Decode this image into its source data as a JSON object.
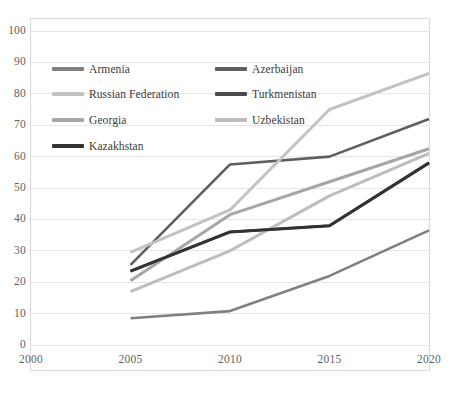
{
  "chart_data": {
    "type": "line",
    "title": "",
    "xlabel": "",
    "ylabel": "",
    "categories": [
      2000,
      2005,
      2010,
      2015,
      2020
    ],
    "xlim": [
      2000,
      2020
    ],
    "ylim": [
      0,
      100
    ],
    "ytick_step": 10,
    "grid": "horizontal",
    "legend_position": "inside-top-left",
    "yticks": [
      "0",
      "10",
      "20",
      "30",
      "40",
      "50",
      "60",
      "70",
      "80",
      "90",
      "100"
    ],
    "xticks": [
      "2000",
      "2005",
      "2010",
      "2015",
      "2020"
    ],
    "series": [
      {
        "name": "Armenia",
        "color": "#808080",
        "width": 2.6,
        "x": [
          2005,
          2010,
          2015,
          2020
        ],
        "values": [
          8.5,
          10.8,
          22.0,
          36.5
        ]
      },
      {
        "name": "Azerbaijan",
        "color": "#5f5f5f",
        "width": 2.6,
        "x": [
          2005,
          2010,
          2015,
          2020
        ],
        "values": [
          25.5,
          57.5,
          60.0,
          72.0
        ]
      },
      {
        "name": "Russian Federation",
        "color": "#c2c2c2",
        "width": 3.0,
        "x": [
          2005,
          2010,
          2015,
          2020
        ],
        "values": [
          29.5,
          43.0,
          75.0,
          86.5
        ]
      },
      {
        "name": "Turkmenistan",
        "color": "#3c3c3c",
        "width": 2.6,
        "x": [
          2005,
          2010,
          2015,
          2020
        ],
        "values": [
          23.5,
          36.0,
          38.0,
          58.0
        ]
      },
      {
        "name": "Georgia",
        "color": "#a6a6a6",
        "width": 3.0,
        "x": [
          2005,
          2010,
          2015,
          2020
        ],
        "values": [
          20.5,
          41.5,
          52.0,
          62.5
        ]
      },
      {
        "name": "Uzbekistan",
        "color": "#bdbdbd",
        "width": 3.0,
        "x": [
          2005,
          2010,
          2015,
          2020
        ],
        "values": [
          17.0,
          30.0,
          47.5,
          61.0
        ]
      },
      {
        "name": "Kazakhstan",
        "color": "#333333",
        "width": 3.0,
        "x": [
          2005,
          2010,
          2015,
          2020
        ],
        "values": [
          23.5,
          36.0,
          38.0,
          58.0
        ]
      }
    ]
  },
  "legend": {
    "rows": [
      {
        "left": {
          "label": "Armenia",
          "color": "#808080",
          "thickness": 4
        },
        "right": {
          "label": "Azerbaijan",
          "color": "#5f5f5f",
          "thickness": 4
        }
      },
      {
        "left": {
          "label": "Russian Federation",
          "color": "#c2c2c2",
          "thickness": 4
        },
        "right": {
          "label": "Turkmenistan",
          "color": "#4a4a4a",
          "thickness": 4
        }
      },
      {
        "left": {
          "label": "Georgia",
          "color": "#a6a6a6",
          "thickness": 4
        },
        "right": {
          "label": "Uzbekistan",
          "color": "#bdbdbd",
          "thickness": 4
        }
      },
      {
        "left": {
          "label": "Kazakhstan",
          "color": "#333333",
          "thickness": 4
        },
        "right": {
          "label": "",
          "color": "transparent",
          "thickness": 0
        }
      }
    ]
  },
  "style": {
    "grid_color": "#e6e6e6",
    "frame_color": "#d9d9d9",
    "tick_text_color": "#5f5f5f",
    "background": "#ffffff"
  }
}
